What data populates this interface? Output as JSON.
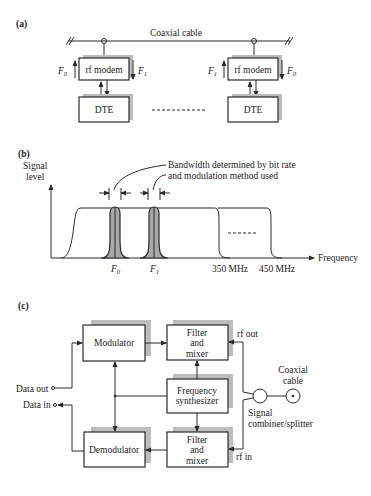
{
  "panel_a": {
    "label": "(a)",
    "cable_label": "Coaxial cable",
    "left_station": {
      "modem_label": "rf modem",
      "dte_label": "DTE",
      "up_freq": "F",
      "up_sub": "0",
      "down_freq": "F",
      "down_sub": "1"
    },
    "right_station": {
      "modem_label": "rf modem",
      "dte_label": "DTE",
      "up_freq": "F",
      "up_sub": "1",
      "down_freq": "F",
      "down_sub": "0"
    },
    "ellipsis": "- - - - - - - - - -"
  },
  "panel_b": {
    "label": "(b)",
    "y_axis_label_line1": "Signal",
    "y_axis_label_line2": "level",
    "x_axis_label": "Frequency",
    "annotation_line1": "Bandwidth determined by bit rate",
    "annotation_line2": "and modulation method used",
    "carriers": [
      {
        "name": "F",
        "sub": "0"
      },
      {
        "name": "F",
        "sub": "1"
      }
    ],
    "band_markers": [
      "350 MHz",
      "450 MHz"
    ],
    "ellipsis": "------"
  },
  "panel_c": {
    "label": "(c)",
    "blocks": {
      "modulator": "Modulator",
      "demodulator": "Demodulator",
      "filter_top_line1": "Filter",
      "filter_top_line2": "and",
      "filter_top_line3": "mixer",
      "filter_bottom_line1": "Filter",
      "filter_bottom_line2": "and",
      "filter_bottom_line3": "mixer",
      "synth_line1": "Frequency",
      "synth_line2": "synthesizer"
    },
    "ports": {
      "data_out": "Data out",
      "data_in": "Data in",
      "rf_out": "rf out",
      "rf_in": "rf in"
    },
    "combiner_line1": "Signal",
    "combiner_line2": "combiner/splitter",
    "cable_line1": "Coaxial",
    "cable_line2": "cable"
  }
}
